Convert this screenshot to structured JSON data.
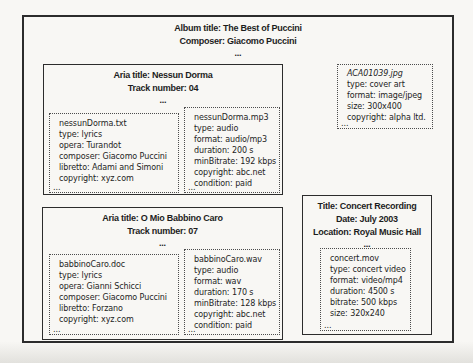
{
  "album": {
    "title_line": "Album title: The Best of Puccini",
    "composer_line": "Composer: Giacomo Puccini",
    "ellipsis": "..."
  },
  "tracks": [
    {
      "title_line": "Aria title: Nessun Dorma",
      "number_line": "Track number: 04",
      "ellipsis": "...",
      "files": [
        {
          "name": "nessunDorma.txt",
          "lines": [
            "type: lyrics",
            "opera: Turandot",
            "composer: Giacomo Puccini",
            "libretto: Adami and Simoni",
            "copyright: xyz.com"
          ],
          "ellipsis": "..."
        },
        {
          "name": "nessunDorma.mp3",
          "lines": [
            "type: audio",
            "format: audio/mp3",
            "duration: 200 s",
            "minBitrate: 192 kbps",
            "copyright: abc.net",
            "condition: paid"
          ],
          "ellipsis": "..."
        }
      ]
    },
    {
      "title_line": "Aria title: O Mio Babbino Caro",
      "number_line": "Track number: 07",
      "ellipsis": "...",
      "files": [
        {
          "name": "babbinoCaro.doc",
          "lines": [
            "type: lyrics",
            "opera: Gianni Schicci",
            "composer: Giacomo Puccini",
            "libretto: Forzano",
            "copyright: xyz.com"
          ],
          "ellipsis": "..."
        },
        {
          "name": "babbinoCaro.wav",
          "lines": [
            "type: audio",
            "format: wav",
            "duration: 170 s",
            "minBitrate: 128 kbps",
            "copyright: abc.net",
            "condition: paid"
          ],
          "ellipsis": "..."
        }
      ]
    }
  ],
  "cover_art": {
    "name": "ACA01039.jpg",
    "lines": [
      "type: cover art",
      "format: image/jpeg",
      "size: 300x400",
      "copyright: alpha ltd."
    ],
    "ellipsis": "..."
  },
  "concert": {
    "title_line": "Title: Concert Recording",
    "date_line": "Date: July 2003",
    "location_line": "Location: Royal Music Hall",
    "ellipsis": "...",
    "file": {
      "name": "concert.mov",
      "lines": [
        "type: concert video",
        "format: video/mp4",
        "duration: 4500 s",
        "bitrate: 500 kbps",
        "size: 320x240"
      ],
      "ellipsis": "..."
    }
  }
}
